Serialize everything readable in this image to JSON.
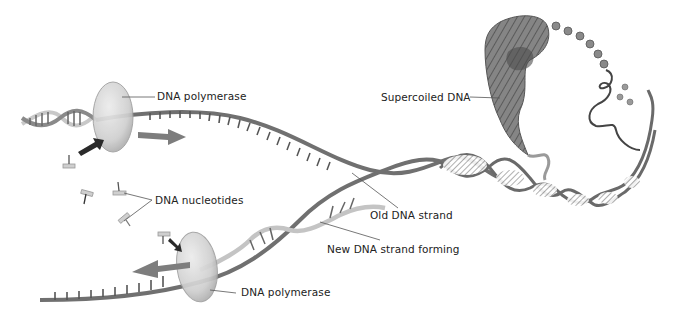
{
  "diagram": {
    "colors": {
      "old_strand": "#6b6b6b",
      "new_strand": "#c8c8c8",
      "polymerase": "#d4d4d4",
      "arrow": "#7a7a7a",
      "supercoil": "#777777",
      "background": "#ffffff",
      "text": "#222222"
    },
    "labels": {
      "polymerase_top": "DNA polymerase",
      "polymerase_bottom": "DNA polymerase",
      "nucleotides": "DNA nucleotides",
      "old_strand": "Old DNA strand",
      "new_strand": "New DNA strand forming",
      "supercoiled": "Supercoiled DNA"
    }
  }
}
